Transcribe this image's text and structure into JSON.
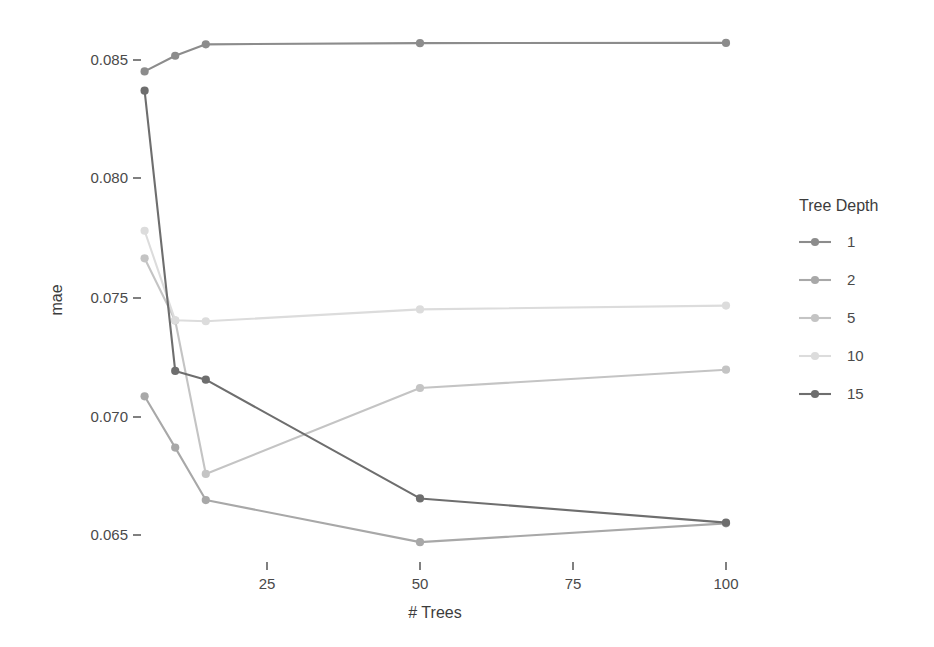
{
  "chart_data": {
    "type": "line",
    "title": "",
    "xlabel": "# Trees",
    "ylabel": "mae",
    "xlim": [
      0,
      107
    ],
    "ylim": [
      0.0635,
      0.0868
    ],
    "grid": false,
    "legend_position": "right",
    "legend_title": "Tree Depth",
    "x": [
      5,
      10,
      15,
      50,
      100
    ],
    "xticks": [
      25,
      50,
      75,
      100
    ],
    "xtick_labels": [
      "25",
      "50",
      "75",
      "100"
    ],
    "yticks": [
      0.065,
      0.07,
      0.075,
      0.08,
      0.085
    ],
    "ytick_labels": [
      "0.065",
      "0.070",
      "0.075",
      "0.080",
      "0.085"
    ],
    "series": [
      {
        "name": "1",
        "color": "#8c8c8c",
        "values": [
          0.08452,
          0.08518,
          0.08566,
          0.08571,
          0.08572
        ]
      },
      {
        "name": "2",
        "color": "#a8a8a8",
        "values": [
          0.07084,
          0.06868,
          0.06647,
          0.0647,
          0.06549
        ]
      },
      {
        "name": "5",
        "color": "#c4c4c4",
        "values": [
          0.07665,
          0.07403,
          0.06757,
          0.07119,
          0.07196
        ]
      },
      {
        "name": "10",
        "color": "#dcdcdc",
        "values": [
          0.07781,
          0.07404,
          0.074,
          0.0745,
          0.07466
        ]
      },
      {
        "name": "15",
        "color": "#6e6e6e",
        "values": [
          0.08371,
          0.07191,
          0.07154,
          0.06654,
          0.06552
        ]
      }
    ]
  },
  "legend": {
    "title": "Tree Depth",
    "entries": [
      {
        "label": "1",
        "color": "#8c8c8c"
      },
      {
        "label": "2",
        "color": "#a8a8a8"
      },
      {
        "label": "5",
        "color": "#c4c4c4"
      },
      {
        "label": "10",
        "color": "#dcdcdc"
      },
      {
        "label": "15",
        "color": "#6e6e6e"
      }
    ]
  },
  "axes": {
    "x_title": "# Trees",
    "y_title": "mae",
    "x_tick_labels": [
      "25",
      "50",
      "75",
      "100"
    ],
    "y_tick_labels": [
      "0.065",
      "0.070",
      "0.075",
      "0.080",
      "0.085"
    ]
  }
}
